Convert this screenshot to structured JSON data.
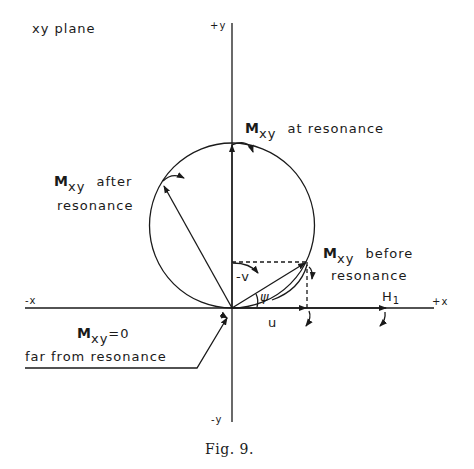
{
  "title": "xy plane",
  "axes": {
    "pos_y": "+y",
    "neg_y": "-y",
    "pos_x": "+x",
    "neg_x": "-x"
  },
  "labels": {
    "m_symbol": "M",
    "m_subscript": "xy",
    "at_resonance": "at resonance",
    "after_line1": "after",
    "after_line2": "resonance",
    "before_line1": "before",
    "before_line2": "resonance",
    "zero_value": "=0",
    "far_from": "far from resonance",
    "h1": "H",
    "h1_sub": "1",
    "u": "u",
    "neg_v": "-v",
    "psi": "ψ"
  },
  "caption": "Fig. 9."
}
